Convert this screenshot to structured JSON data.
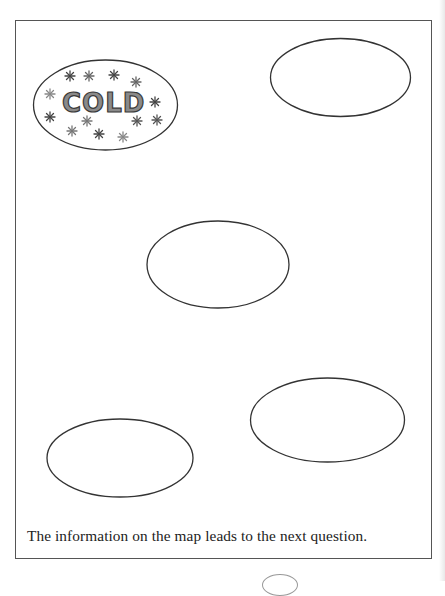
{
  "map": {
    "caption": "The information on the map leads to the next question.",
    "ovals": [
      {
        "id": "cold",
        "label": "COLD",
        "cx": 105.5,
        "cy": 105,
        "rx": 72,
        "ry": 45,
        "decorated": true
      },
      {
        "id": "top-right",
        "label": "",
        "cx": 340.5,
        "cy": 77.5,
        "rx": 70,
        "ry": 39
      },
      {
        "id": "middle",
        "label": "",
        "cx": 218,
        "cy": 264.5,
        "rx": 71,
        "ry": 43.5
      },
      {
        "id": "lower-right",
        "label": "",
        "cx": 327.5,
        "cy": 420,
        "rx": 77,
        "ry": 42
      },
      {
        "id": "lower-left",
        "label": "",
        "cx": 120,
        "cy": 458,
        "rx": 73,
        "ry": 39
      }
    ],
    "cold_label": "COLD",
    "snowflake_glyph": "✱",
    "colors": {
      "oval_stroke": "#333333",
      "border": "#555555",
      "cold_fill": "#8a8a8a",
      "snowflake": "#4a4a4a"
    }
  }
}
